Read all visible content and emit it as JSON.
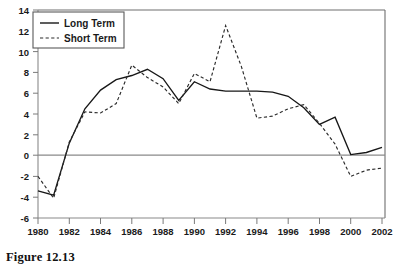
{
  "figure": {
    "caption": "Figure 12.13"
  },
  "legend": {
    "position": "top-left",
    "entries": [
      {
        "label": "Long Term",
        "style": "solid"
      },
      {
        "label": "Short Term",
        "style": "dashed"
      }
    ]
  },
  "chart_data": {
    "type": "line",
    "title": "",
    "xlabel": "",
    "ylabel": "",
    "xlim": [
      1980,
      2002
    ],
    "ylim": [
      -6,
      14
    ],
    "grid": false,
    "legend_position": "top-left",
    "x": [
      1980,
      1981,
      1982,
      1983,
      1984,
      1985,
      1986,
      1987,
      1988,
      1989,
      1990,
      1991,
      1992,
      1993,
      1994,
      1995,
      1996,
      1997,
      1998,
      1999,
      2000,
      2001,
      2002
    ],
    "xticks": [
      1980,
      1982,
      1984,
      1986,
      1988,
      1990,
      1992,
      1994,
      1996,
      1998,
      2000,
      2002
    ],
    "xtick_labels": [
      "1980",
      "1982",
      "1984",
      "1986",
      "1988",
      "1990",
      "1992",
      "1994",
      "1996",
      "1998",
      "2000",
      "2002"
    ],
    "yticks": [
      -6,
      -4,
      -2,
      0,
      2,
      4,
      6,
      8,
      10,
      12,
      14
    ],
    "ytick_labels": [
      "-6",
      "-4",
      "-2",
      "0",
      "2",
      "4",
      "6",
      "8",
      "10",
      "12",
      "14"
    ],
    "series": [
      {
        "name": "Long Term",
        "style": "solid",
        "color": "#171717",
        "values": [
          -3.4,
          -3.8,
          1.2,
          4.5,
          6.3,
          7.3,
          7.7,
          8.3,
          7.4,
          5.3,
          7.1,
          6.4,
          6.2,
          6.2,
          6.2,
          6.1,
          5.7,
          4.6,
          3.0,
          3.7,
          0.1,
          0.3,
          0.8
        ]
      },
      {
        "name": "Short Term",
        "style": "dashed",
        "color": "#2a2a2a",
        "values": [
          -2.0,
          -4.1,
          1.3,
          4.2,
          4.1,
          5.0,
          8.7,
          7.5,
          6.6,
          5.0,
          7.9,
          7.1,
          12.5,
          8.6,
          3.6,
          3.8,
          4.5,
          4.9,
          3.1,
          1.1,
          -2.0,
          -1.4,
          -1.2
        ]
      }
    ]
  }
}
